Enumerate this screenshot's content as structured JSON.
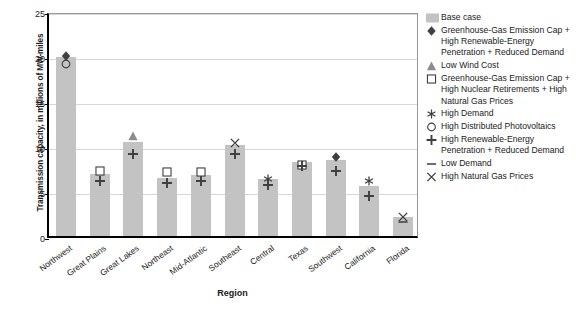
{
  "chart_data": {
    "type": "bar",
    "title": "",
    "xlabel": "Region",
    "ylabel": "Transmission capacity, in millions of MW-miles",
    "ylim": [
      0,
      25
    ],
    "yticks": [
      0,
      5,
      10,
      15,
      20,
      25
    ],
    "grid": true,
    "legend_position": "right",
    "categories": [
      "Northwest",
      "Great Plains",
      "Great Lakes",
      "Northeast",
      "Mid-Atlantic",
      "Southeast",
      "Central",
      "Texas",
      "Southwest",
      "California",
      "Florida"
    ],
    "series": [
      {
        "name": "Base case",
        "marker": "bar",
        "values": [
          19.9,
          6.9,
          10.4,
          6.4,
          6.8,
          10.1,
          6.3,
          8.2,
          8.4,
          5.6,
          2.1
        ]
      },
      {
        "name": "Greenhouse-Gas Emission Cap + High Renewable-Energy Penetration + Reduced Demand",
        "marker": "diamond",
        "values": [
          20.3,
          null,
          null,
          null,
          null,
          null,
          null,
          null,
          9.1,
          null,
          null
        ]
      },
      {
        "name": "Low Wind Cost",
        "marker": "triangle",
        "values": [
          null,
          null,
          11.5,
          null,
          null,
          null,
          null,
          null,
          null,
          null,
          null
        ]
      },
      {
        "name": "Greenhouse-Gas Emission Cap + High Nuclear Retirements + High Natural Gas Prices",
        "marker": "square",
        "values": [
          null,
          7.6,
          null,
          7.4,
          7.5,
          null,
          null,
          8.2,
          null,
          null,
          null
        ]
      },
      {
        "name": "High Demand",
        "marker": "asterisk",
        "values": [
          null,
          null,
          null,
          null,
          null,
          null,
          6.7,
          null,
          null,
          6.4,
          null
        ]
      },
      {
        "name": "High Distributed Photovoltaics",
        "marker": "circle",
        "values": [
          19.4,
          null,
          null,
          null,
          null,
          null,
          null,
          null,
          null,
          null,
          null
        ]
      },
      {
        "name": "High Renewable-Energy Penetration + Reduced Demand",
        "marker": "plus",
        "values": [
          null,
          6.5,
          9.4,
          6.2,
          6.4,
          9.5,
          6.0,
          8.1,
          7.6,
          4.8,
          null
        ]
      },
      {
        "name": "Low Demand",
        "marker": "dash",
        "values": [
          null,
          null,
          null,
          null,
          null,
          null,
          null,
          null,
          null,
          null,
          1.9
        ]
      },
      {
        "name": "High Natural Gas Prices",
        "marker": "x",
        "values": [
          null,
          null,
          null,
          null,
          null,
          10.7,
          null,
          null,
          null,
          null,
          2.5
        ]
      }
    ],
    "colors": {
      "bar": "#c3c3c3",
      "marker_dark": "#3f3f3f",
      "marker_gray": "#8c8c8c",
      "gridline": "#d7d7d7",
      "axis": "#000000"
    }
  },
  "legend": {
    "items": [
      {
        "marker": "bar",
        "label": "Base case"
      },
      {
        "marker": "diamond",
        "label": "Greenhouse-Gas Emission Cap + High Renewable-Energy Penetration + Reduced Demand"
      },
      {
        "marker": "triangle",
        "label": "Low Wind Cost"
      },
      {
        "marker": "square",
        "label": "Greenhouse-Gas Emission Cap + High Nuclear Retirements + High Natural Gas Prices"
      },
      {
        "marker": "asterisk",
        "label": "High Demand"
      },
      {
        "marker": "circle",
        "label": "High Distributed Photovoltaics"
      },
      {
        "marker": "plus",
        "label": "High Renewable-Energy Penetration + Reduced Demand"
      },
      {
        "marker": "dash",
        "label": "Low Demand"
      },
      {
        "marker": "x",
        "label": "High Natural Gas Prices"
      }
    ]
  }
}
